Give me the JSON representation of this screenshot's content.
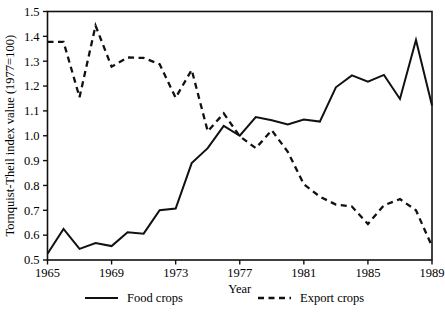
{
  "figure": {
    "cropped_title_remnant": "",
    "background_color": "#ffffff",
    "ink_color": "#111111"
  },
  "chart_data": {
    "type": "line",
    "title": "",
    "xlabel": "Year",
    "ylabel": "Tornquist-Theil index value (1977=100)",
    "xlim": [
      1965,
      1989
    ],
    "ylim": [
      0.5,
      1.5
    ],
    "grid": false,
    "legend_position": "bottom",
    "xticks": [
      1965,
      1969,
      1973,
      1977,
      1981,
      1985,
      1989
    ],
    "xtick_labels": [
      "1965",
      "1969",
      "1973",
      "1977",
      "1981",
      "1985",
      "1989"
    ],
    "yticks": [
      0.5,
      0.6,
      0.7,
      0.8,
      0.9,
      1.0,
      1.1,
      1.2,
      1.3,
      1.4,
      1.5
    ],
    "ytick_labels": [
      "0.5",
      "0.6",
      "0.7",
      "0.8",
      "0.9",
      "1.0",
      "1.1",
      "1.2",
      "1.3",
      "1.4",
      "1.5"
    ],
    "x": [
      1965,
      1966,
      1967,
      1968,
      1969,
      1970,
      1971,
      1972,
      1973,
      1974,
      1975,
      1976,
      1977,
      1978,
      1979,
      1980,
      1981,
      1982,
      1983,
      1984,
      1985,
      1986,
      1987,
      1988,
      1989
    ],
    "series": [
      {
        "name": "Food crops",
        "style": "solid",
        "values": [
          0.525,
          0.625,
          0.545,
          0.568,
          0.556,
          0.612,
          0.606,
          0.7,
          0.707,
          0.89,
          0.95,
          1.04,
          1.0,
          1.075,
          1.062,
          1.045,
          1.065,
          1.057,
          1.195,
          1.243,
          1.218,
          1.245,
          1.148,
          1.385,
          1.122
        ]
      },
      {
        "name": "Export crops",
        "style": "dashed",
        "values": [
          1.378,
          1.378,
          1.155,
          1.443,
          1.278,
          1.315,
          1.313,
          1.288,
          1.153,
          1.265,
          1.018,
          1.09,
          0.998,
          0.95,
          1.022,
          0.935,
          0.805,
          0.755,
          0.723,
          0.715,
          0.645,
          0.72,
          0.745,
          0.7,
          0.555
        ]
      }
    ]
  },
  "legend": {
    "entries": [
      {
        "label": "Food crops",
        "style": "solid"
      },
      {
        "label": "Export crops",
        "style": "dashed"
      }
    ]
  }
}
